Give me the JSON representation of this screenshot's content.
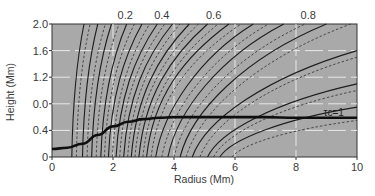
{
  "chart_data": {
    "type": "line",
    "title": "",
    "xlabel": "Radius (Mm)",
    "ylabel": "Height (Mm)",
    "xlim": [
      0,
      10
    ],
    "ylim": [
      0,
      2.0
    ],
    "grid": true,
    "x_ticks": [
      0,
      2,
      4,
      6,
      8,
      10
    ],
    "x_tick_labels": [
      "0",
      "2",
      "4",
      "6",
      "8",
      "10"
    ],
    "y_ticks": [
      0,
      0.4,
      0.8,
      1.2,
      1.6,
      2.0
    ],
    "y_tick_labels": [
      "0",
      "0.4",
      "0.0",
      "1.2",
      "1.6",
      "2.0"
    ],
    "top_axis_labels": [
      {
        "label": "0.2",
        "r": 2.4
      },
      {
        "label": "0.4",
        "r": 3.6
      },
      {
        "label": "0.6",
        "r": 5.3
      },
      {
        "label": "0.8",
        "r": 8.4
      }
    ],
    "annotations": [
      {
        "text": "τc=1",
        "r": 8.9,
        "h": 0.68
      }
    ],
    "tau_curve": {
      "name": "τc=1",
      "points": [
        [
          0,
          0.12
        ],
        [
          0.5,
          0.14
        ],
        [
          1.0,
          0.2
        ],
        [
          1.5,
          0.33
        ],
        [
          2.0,
          0.46
        ],
        [
          2.5,
          0.53
        ],
        [
          3.0,
          0.57
        ],
        [
          3.5,
          0.59
        ],
        [
          4.0,
          0.6
        ],
        [
          5,
          0.6
        ],
        [
          6,
          0.6
        ],
        [
          7,
          0.6
        ],
        [
          8,
          0.59
        ],
        [
          9,
          0.59
        ],
        [
          10,
          0.59
        ]
      ]
    },
    "fieldlines_solid": [
      {
        "r0": 0.65,
        "r1": 1.05
      },
      {
        "r0": 1.0,
        "r1": 1.5
      },
      {
        "r0": 1.3,
        "r1": 1.95
      },
      {
        "r0": 1.6,
        "r1": 2.45
      },
      {
        "r0": 1.85,
        "r1": 2.95
      },
      {
        "r0": 2.1,
        "r1": 3.45
      },
      {
        "r0": 2.35,
        "r1": 3.95
      },
      {
        "r0": 2.6,
        "r1": 4.5
      },
      {
        "r0": 2.85,
        "r1": 5.1
      },
      {
        "r0": 3.1,
        "r1": 5.8
      },
      {
        "r0": 3.4,
        "r1": 6.6
      },
      {
        "r0": 3.8,
        "r1": 7.6
      },
      {
        "r0": 4.2,
        "r1": 9.0
      },
      {
        "r0": 4.6,
        "r1": 10.0,
        "h1": 1.6
      },
      {
        "r0": 5.1,
        "r1": 10.0,
        "h1": 1.1
      },
      {
        "r0": 5.5,
        "r1": 10.0,
        "h1": 0.75
      }
    ],
    "fieldlines_dashed": [
      {
        "r0": 0.8,
        "r1": 1.25
      },
      {
        "r0": 1.15,
        "r1": 1.75
      },
      {
        "r0": 1.45,
        "r1": 2.2
      },
      {
        "r0": 1.72,
        "r1": 2.7
      },
      {
        "r0": 1.98,
        "r1": 3.2
      },
      {
        "r0": 2.22,
        "r1": 3.7
      },
      {
        "r0": 2.48,
        "r1": 4.2
      },
      {
        "r0": 2.72,
        "r1": 4.8
      },
      {
        "r0": 2.98,
        "r1": 5.45
      },
      {
        "r0": 3.25,
        "r1": 6.2
      },
      {
        "r0": 3.6,
        "r1": 7.1
      },
      {
        "r0": 4.0,
        "r1": 8.3
      },
      {
        "r0": 4.4,
        "r1": 9.8
      },
      {
        "r0": 4.85,
        "r1": 10.0,
        "h1": 1.5
      },
      {
        "r0": 5.3,
        "r1": 10.0,
        "h1": 1.0
      },
      {
        "r0": 5.9,
        "r1": 10.0,
        "h1": 0.55
      }
    ],
    "colors": {
      "plot_background": "#a9a9a9",
      "grid": "#e8e8e8",
      "solid_line": "#1e1e1e",
      "dashed_line": "#3c3c3c",
      "tau_curve": "#0e0e0e",
      "text": "#3a3a3a"
    }
  }
}
